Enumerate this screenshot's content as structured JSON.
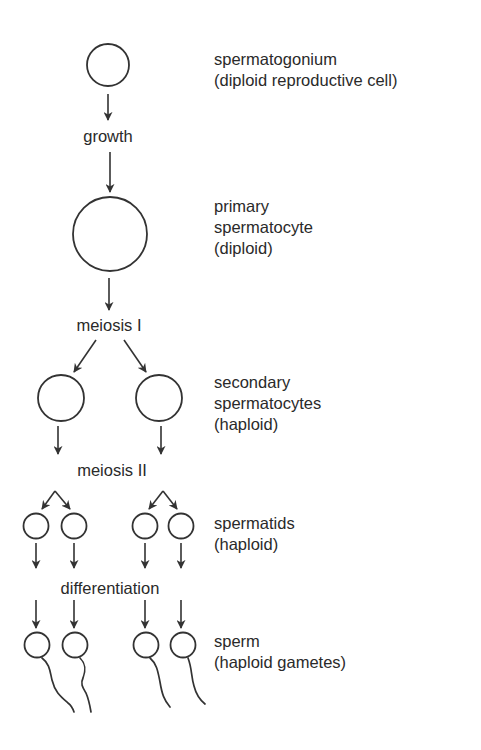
{
  "diagram": {
    "stages": [
      {
        "id": "spermatogonium",
        "lines": [
          "spermatogonium",
          "(diploid reproductive cell)"
        ]
      },
      {
        "id": "primary-spermatocyte",
        "lines": [
          "primary",
          "spermatocyte",
          "(diploid)"
        ]
      },
      {
        "id": "secondary-spermatocytes",
        "lines": [
          "secondary",
          "spermatocytes",
          "(haploid)"
        ]
      },
      {
        "id": "spermatids",
        "lines": [
          "spermatids",
          "(haploid)"
        ]
      },
      {
        "id": "sperm",
        "lines": [
          "sperm",
          "(haploid gametes)"
        ]
      }
    ],
    "processes": {
      "growth": "growth",
      "meiosis_1": "meiosis I",
      "meiosis_2": "meiosis II",
      "differentiation": "differentiation"
    },
    "colors": {
      "line": "#333333",
      "text": "#2a2a2a",
      "background": "#ffffff"
    }
  }
}
